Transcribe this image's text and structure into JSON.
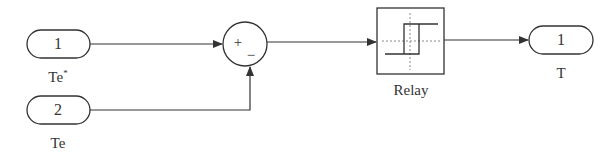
{
  "diagram": {
    "inports": [
      {
        "number": "1",
        "label": "Te",
        "label_sup": "*"
      },
      {
        "number": "2",
        "label": "Te",
        "label_sup": ""
      }
    ],
    "sum": {
      "signs": [
        "+",
        "−"
      ]
    },
    "relay": {
      "label": "Relay"
    },
    "outport": {
      "number": "1",
      "label": "T"
    }
  },
  "colors": {
    "line": "#333333",
    "background": "#ffffff",
    "dotted": "#888888"
  }
}
